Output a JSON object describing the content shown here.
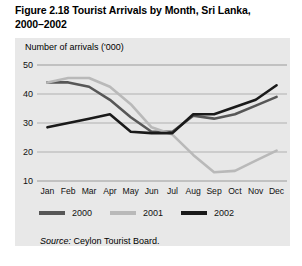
{
  "figure": {
    "number": "Figure 2.18",
    "title_line1": "Figure 2.18  Tourist Arrivals by Month, Sri Lanka,",
    "title_line2": "2000–2002",
    "axis_title": "Number of arrivals ('000)",
    "source_label": "Source:",
    "source_text": " Ceylon Tourist Board."
  },
  "colors": {
    "panel_background": "#e8e8e8",
    "gridline": "#9a9a9a",
    "series_2000": "#575757",
    "series_2001": "#b9b9b9",
    "series_2002": "#1a1a1a"
  },
  "legend": {
    "items": [
      {
        "label": "2000",
        "color": "#575757"
      },
      {
        "label": "2001",
        "color": "#b9b9b9"
      },
      {
        "label": "2002",
        "color": "#1a1a1a"
      }
    ]
  },
  "chart_data": {
    "type": "line",
    "title": "Figure 2.18  Tourist Arrivals by Month, Sri Lanka, 2000–2002",
    "xlabel": "",
    "ylabel": "Number of arrivals ('000)",
    "ylim": [
      10,
      50
    ],
    "yticks": [
      10,
      20,
      30,
      40,
      50
    ],
    "ytick_labels": [
      "10",
      "20",
      "30",
      "40",
      "50"
    ],
    "grid": true,
    "legend_position": "below-axis",
    "categories": [
      "Jan",
      "Feb",
      "Mar",
      "Apr",
      "May",
      "Jun",
      "Jul",
      "Aug",
      "Sep",
      "Oct",
      "Nov",
      "Dec"
    ],
    "series": [
      {
        "name": "2000",
        "color": "#575757",
        "values": [
          44.0,
          44.0,
          42.5,
          38.0,
          32.0,
          27.0,
          27.0,
          32.5,
          31.5,
          33.0,
          36.0,
          39.0
        ]
      },
      {
        "name": "2001",
        "color": "#b9b9b9",
        "values": [
          44.0,
          45.5,
          45.5,
          42.5,
          36.5,
          28.5,
          26.0,
          19.0,
          13.0,
          13.5,
          17.0,
          20.5
        ]
      },
      {
        "name": "2002",
        "color": "#1a1a1a",
        "values": [
          28.5,
          30.0,
          31.5,
          33.0,
          27.0,
          26.5,
          26.5,
          33.0,
          33.0,
          35.5,
          38.0,
          43.0
        ]
      }
    ],
    "annotations": [],
    "source": "Source: Ceylon Tourist Board."
  }
}
